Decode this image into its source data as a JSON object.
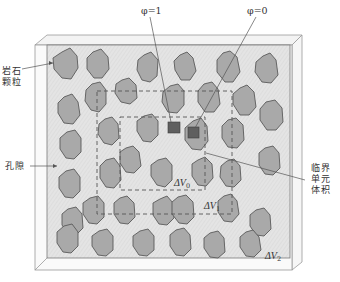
{
  "diagram": {
    "colors": {
      "background": "#ffffff",
      "matrix_fill": "#e2e2e2",
      "grain_fill": "#a8a8a8",
      "grain_stroke": "#555555",
      "marker_fill": "#5f5f5f",
      "frame_stroke": "#9a9a9a",
      "dash_stroke": "#555555",
      "leader_stroke": "#555555"
    },
    "labels": {
      "phi_one": "φ=1",
      "phi_zero": "φ=0",
      "rock_grain_line1": "岩石",
      "rock_grain_line2": "颗粒",
      "pore": "孔隙",
      "rev_line1": "临界",
      "rev_line2": "单元",
      "rev_line3": "体积",
      "dv0_main": "ΔV",
      "dv0_sub": "0",
      "dv1_main": "ΔV",
      "dv1_sub": "1",
      "dv2_main": "ΔV",
      "dv2_sub": "2"
    },
    "volumes": [
      {
        "name": "ΔV0",
        "x": 120,
        "y": 117,
        "w": 85,
        "h": 73
      },
      {
        "name": "ΔV1",
        "x": 97,
        "y": 91,
        "w": 135,
        "h": 123
      },
      {
        "name": "ΔV2",
        "x": 47,
        "y": 45,
        "w": 243,
        "h": 213
      }
    ],
    "markers": [
      {
        "name": "phi=1 (pore point)",
        "x": 168,
        "y": 122,
        "size": 12
      },
      {
        "name": "phi=0 (grain point)",
        "x": 188,
        "y": 127,
        "size": 11
      }
    ]
  }
}
